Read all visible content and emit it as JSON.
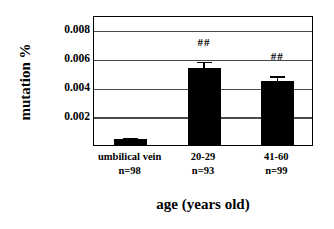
{
  "chart_data": {
    "type": "bar",
    "title": "",
    "xlabel": "age (years old)",
    "ylabel": "mutation %",
    "categories": [
      "umbilical vein",
      "20-29",
      "41-60"
    ],
    "category_sublabels": [
      "n=98",
      "n=93",
      "n=99"
    ],
    "values": [
      0.0004,
      0.0053,
      0.0044
    ],
    "errors": [
      0.0002,
      0.0006,
      0.0005
    ],
    "annotations": [
      "",
      "##",
      "##"
    ],
    "ylim": [
      0,
      0.009
    ],
    "yticks": [
      0.002,
      0.004,
      0.006,
      0.008
    ],
    "ytick_labels": [
      "0.002",
      "0.004",
      "0.006",
      "0.008"
    ],
    "grid": true,
    "grid_axis": "y",
    "legend": false,
    "bar_color": "#000000",
    "frame_color": "#000000",
    "grid_color": "#4a4a4a"
  },
  "axes": {
    "y_title": "mutation %",
    "x_title": "age (years old)"
  },
  "ticks": {
    "y": [
      "0.008",
      "0.006",
      "0.004",
      "0.002"
    ]
  },
  "series": [
    {
      "label": "umbilical vein",
      "sublabel": "n=98",
      "value": 0.0004,
      "error": 0.0002,
      "significance": ""
    },
    {
      "label": "20-29",
      "sublabel": "n=93",
      "value": 0.0053,
      "error": 0.0006,
      "significance": "##"
    },
    {
      "label": "41-60",
      "sublabel": "n=99",
      "value": 0.0044,
      "error": 0.0005,
      "significance": "##"
    }
  ]
}
